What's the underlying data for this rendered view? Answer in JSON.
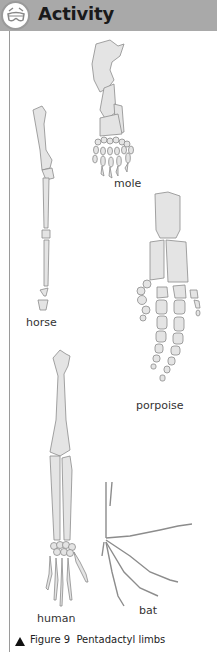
{
  "header": {
    "title": "Activity",
    "icon": "goggles-icon",
    "background": "#a9a9a9"
  },
  "figure": {
    "labels": {
      "mole": "mole",
      "horse": "horse",
      "porpoise": "porpoise",
      "human": "human",
      "bat": "bat"
    },
    "caption": {
      "marker": "▲",
      "number": "Figure 9",
      "text": "Pentadactyl limbs"
    },
    "bone_fill": "#e4e4e4",
    "bone_stroke": "#8c8c8c"
  }
}
